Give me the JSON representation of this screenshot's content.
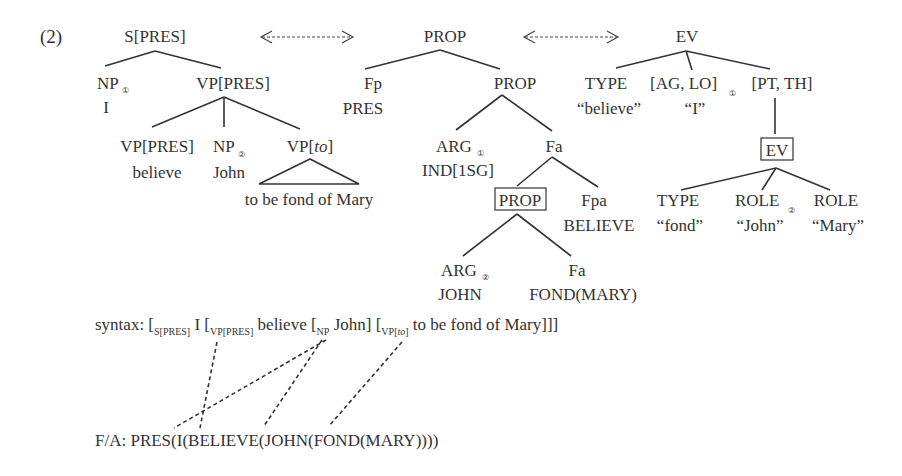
{
  "example_number": "(2)",
  "syntax_tree": {
    "root": "S[PRES]",
    "np1": {
      "label": "NP",
      "index": "①",
      "word": "I"
    },
    "vp_pres": "VP[PRES]",
    "vp_pres_child": {
      "label": "VP[PRES]",
      "word": "believe"
    },
    "np2": {
      "label": "NP",
      "index": "②",
      "word": "John"
    },
    "vp_to": {
      "label_pre": "VP[",
      "label_italic": "to",
      "label_post": "]",
      "word": "to be fond of Mary"
    }
  },
  "prop_tree": {
    "root": "PROP",
    "fp": {
      "label": "Fp",
      "value": "PRES"
    },
    "prop2": "PROP",
    "arg1": {
      "label": "ARG",
      "index": "①",
      "value": "IND[1SG]"
    },
    "fa1": "Fa",
    "prop_boxed": "PROP",
    "fpa": {
      "label": "Fpa",
      "value": "BELIEVE"
    },
    "arg2": {
      "label": "ARG",
      "index": "②",
      "value": "JOHN"
    },
    "fa2": {
      "label": "Fa",
      "value": "FOND(MARY)"
    }
  },
  "ev_tree": {
    "root": "EV",
    "type1": {
      "label": "TYPE",
      "value": "“believe”"
    },
    "ag_lo": {
      "label": "[AG, LO]",
      "index": "①",
      "value": "“I”"
    },
    "pt_th": "[PT, TH]",
    "ev_boxed": "EV",
    "type2": {
      "label": "TYPE",
      "value": "“fond”"
    },
    "role1": {
      "label": "ROLE",
      "index": "②",
      "value": "“John”"
    },
    "role2": {
      "label": "ROLE",
      "value": "“Mary”"
    }
  },
  "syntax_line": {
    "prefix": "syntax: [",
    "s_sub": "S[PRES]",
    "i_text": " I [",
    "vp_sub": "VP[PRES]",
    "believe_text": " believe [",
    "np_sub": "NP",
    "john_text": " John] [",
    "vpto_sub_pre": "VP[",
    "vpto_sub_italic": "to",
    "vpto_sub_post": "]",
    "tail_text": " to be fond of Mary]]]"
  },
  "fa_line": {
    "text": "F/A: PRES(I(BELIEVE(JOHN(FOND(MARY))))"
  }
}
